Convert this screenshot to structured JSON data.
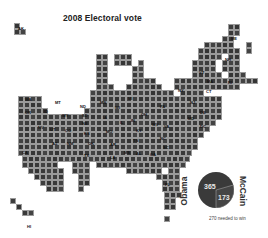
{
  "title": "2008 Electoral vote",
  "colors": {
    "obama": "#3a3a3a",
    "mccain": "#404040",
    "grid": "#9a9a9a",
    "background": "#ffffff"
  },
  "chart_data": {
    "type": "pie",
    "title": "2008 Electoral vote",
    "series": [
      {
        "name": "Obama",
        "value": 365
      },
      {
        "name": "McCain",
        "value": 173
      }
    ],
    "total": 538,
    "annotation": "270 needed to win",
    "cartogram": "US states drawn as grid squares, one square per electoral vote"
  },
  "pie": {
    "obama_label": "Obama",
    "mccain_label": "McCain",
    "obama_value": "365",
    "mccain_value": "173",
    "note": "270 needed to win"
  },
  "states": [
    {
      "abbr": "AK"
    },
    {
      "abbr": "HI"
    },
    {
      "abbr": "WA"
    },
    {
      "abbr": "OR"
    },
    {
      "abbr": "CA"
    },
    {
      "abbr": "NV"
    },
    {
      "abbr": "ID"
    },
    {
      "abbr": "MT"
    },
    {
      "abbr": "WY"
    },
    {
      "abbr": "UT"
    },
    {
      "abbr": "AZ"
    },
    {
      "abbr": "CO"
    },
    {
      "abbr": "NM"
    },
    {
      "abbr": "ND"
    },
    {
      "abbr": "SD"
    },
    {
      "abbr": "NE"
    },
    {
      "abbr": "KS"
    },
    {
      "abbr": "OK"
    },
    {
      "abbr": "TX"
    },
    {
      "abbr": "MN"
    },
    {
      "abbr": "IA"
    },
    {
      "abbr": "MO"
    },
    {
      "abbr": "AR"
    },
    {
      "abbr": "LA"
    },
    {
      "abbr": "WI"
    },
    {
      "abbr": "IL"
    },
    {
      "abbr": "MI"
    },
    {
      "abbr": "IN"
    },
    {
      "abbr": "OH"
    },
    {
      "abbr": "KY"
    },
    {
      "abbr": "TN"
    },
    {
      "abbr": "MS"
    },
    {
      "abbr": "AL"
    },
    {
      "abbr": "GA"
    },
    {
      "abbr": "FL"
    },
    {
      "abbr": "SC"
    },
    {
      "abbr": "NC"
    },
    {
      "abbr": "VA"
    },
    {
      "abbr": "WV"
    },
    {
      "abbr": "PA"
    },
    {
      "abbr": "NY"
    },
    {
      "abbr": "VT"
    },
    {
      "abbr": "NH"
    },
    {
      "abbr": "ME"
    },
    {
      "abbr": "MA"
    },
    {
      "abbr": "RI"
    },
    {
      "abbr": "CT"
    },
    {
      "abbr": "NJ"
    },
    {
      "abbr": "DE"
    },
    {
      "abbr": "MD"
    },
    {
      "abbr": "DC"
    }
  ],
  "labels": [
    {
      "t": "WA",
      "x": 25,
      "y": 97
    },
    {
      "t": "OR",
      "x": 25,
      "y": 110
    },
    {
      "t": "CA",
      "x": 22,
      "y": 150
    },
    {
      "t": "NV",
      "x": 38,
      "y": 125
    },
    {
      "t": "MT",
      "x": 55,
      "y": 100
    },
    {
      "t": "ID",
      "x": 44,
      "y": 109
    },
    {
      "t": "WY",
      "x": 62,
      "y": 113
    },
    {
      "t": "UT",
      "x": 50,
      "y": 127
    },
    {
      "t": "CO",
      "x": 65,
      "y": 128
    },
    {
      "t": "AZ",
      "x": 52,
      "y": 141
    },
    {
      "t": "NM",
      "x": 67,
      "y": 141
    },
    {
      "t": "ND",
      "x": 80,
      "y": 104
    },
    {
      "t": "SD",
      "x": 82,
      "y": 113
    },
    {
      "t": "NE",
      "x": 82,
      "y": 121
    },
    {
      "t": "KS",
      "x": 84,
      "y": 131
    },
    {
      "t": "OK",
      "x": 88,
      "y": 141
    },
    {
      "t": "TX",
      "x": 84,
      "y": 153
    },
    {
      "t": "MN",
      "x": 100,
      "y": 100
    },
    {
      "t": "IA",
      "x": 103,
      "y": 115
    },
    {
      "t": "MO",
      "x": 106,
      "y": 129
    },
    {
      "t": "AR",
      "x": 110,
      "y": 142
    },
    {
      "t": "LA",
      "x": 110,
      "y": 155
    },
    {
      "t": "WI",
      "x": 115,
      "y": 105
    },
    {
      "t": "IL",
      "x": 120,
      "y": 120
    },
    {
      "t": "MI",
      "x": 128,
      "y": 96
    },
    {
      "t": "IN",
      "x": 131,
      "y": 118
    },
    {
      "t": "OH",
      "x": 141,
      "y": 112
    },
    {
      "t": "KY",
      "x": 136,
      "y": 128
    },
    {
      "t": "TN",
      "x": 133,
      "y": 138
    },
    {
      "t": "MS",
      "x": 124,
      "y": 150
    },
    {
      "t": "AL",
      "x": 136,
      "y": 151
    },
    {
      "t": "GA",
      "x": 150,
      "y": 152
    },
    {
      "t": "FL",
      "x": 165,
      "y": 182
    },
    {
      "t": "SC",
      "x": 163,
      "y": 145
    },
    {
      "t": "NC",
      "x": 160,
      "y": 136
    },
    {
      "t": "VA",
      "x": 164,
      "y": 124
    },
    {
      "t": "WV",
      "x": 152,
      "y": 122
    },
    {
      "t": "PA",
      "x": 160,
      "y": 104
    },
    {
      "t": "NY",
      "x": 178,
      "y": 88
    },
    {
      "t": "VT",
      "x": 199,
      "y": 70
    },
    {
      "t": "NH",
      "x": 225,
      "y": 57
    },
    {
      "t": "ME",
      "x": 231,
      "y": 36
    },
    {
      "t": "MA",
      "x": 207,
      "y": 79
    },
    {
      "t": "RI",
      "x": 228,
      "y": 80
    },
    {
      "t": "CT",
      "x": 206,
      "y": 89
    },
    {
      "t": "NJ",
      "x": 190,
      "y": 100
    },
    {
      "t": "DE",
      "x": 200,
      "y": 110
    },
    {
      "t": "MD",
      "x": 188,
      "y": 116
    },
    {
      "t": "DC",
      "x": 200,
      "y": 124
    },
    {
      "t": "AK",
      "x": 18,
      "y": 26
    },
    {
      "t": "HI",
      "x": 27,
      "y": 224
    }
  ]
}
